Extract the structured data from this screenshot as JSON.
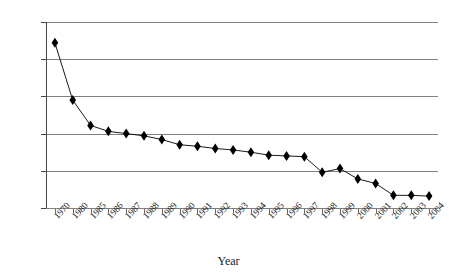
{
  "chart_data": {
    "type": "line",
    "title": "",
    "subtitle": "",
    "xlabel": "Year",
    "ylabel": "",
    "grid": true,
    "legend": false,
    "marker": "diamond",
    "ylim": [
      0,
      250
    ],
    "yticks": [
      0,
      50,
      100,
      150,
      200,
      250
    ],
    "categories": [
      "1970",
      "1980",
      "1985",
      "1986",
      "1987",
      "1988",
      "1989",
      "1990",
      "1991",
      "1992",
      "1993",
      "1994",
      "1995",
      "1996",
      "1997",
      "1998",
      "1999",
      "2000",
      "2001",
      "2002",
      "2003",
      "2004"
    ],
    "x": [
      "1970",
      "1980",
      "1985",
      "1986",
      "1987",
      "1988",
      "1989",
      "1990",
      "1991",
      "1992",
      "1993",
      "1994",
      "1995",
      "1996",
      "1997",
      "1998",
      "1999",
      "2000",
      "2001",
      "2002",
      "2003",
      "2004"
    ],
    "values": [
      222,
      145,
      111,
      103,
      100,
      97,
      92,
      85,
      83,
      80,
      78,
      75,
      71,
      70,
      69,
      48,
      53,
      39,
      33,
      17,
      17,
      16
    ],
    "points": [
      {
        "x": "1970",
        "y": 222
      },
      {
        "x": "1980",
        "y": 145
      },
      {
        "x": "1985",
        "y": 111
      },
      {
        "x": "1986",
        "y": 103
      },
      {
        "x": "1987",
        "y": 100
      },
      {
        "x": "1988",
        "y": 97
      },
      {
        "x": "1989",
        "y": 92
      },
      {
        "x": "1990",
        "y": 85
      },
      {
        "x": "1991",
        "y": 83
      },
      {
        "x": "1992",
        "y": 80
      },
      {
        "x": "1993",
        "y": 78
      },
      {
        "x": "1994",
        "y": 75
      },
      {
        "x": "1995",
        "y": 71
      },
      {
        "x": "1996",
        "y": 70
      },
      {
        "x": "1997",
        "y": 69
      },
      {
        "x": "1998",
        "y": 48
      },
      {
        "x": "1999",
        "y": 53
      },
      {
        "x": "2000",
        "y": 39
      },
      {
        "x": "2001",
        "y": 33
      },
      {
        "x": "2002",
        "y": 17
      },
      {
        "x": "2003",
        "y": 17
      },
      {
        "x": "2004",
        "y": 16
      }
    ],
    "series_color": "#000000",
    "grid_color": "#808080"
  },
  "axis": {
    "x_title": "Year",
    "y_tick_labels": [
      "0",
      "50",
      "100",
      "150",
      "200",
      "250"
    ],
    "x_tick_labels": [
      "1970",
      "1980",
      "1985",
      "1986",
      "1987",
      "1988",
      "1989",
      "1990",
      "1991",
      "1992",
      "1993",
      "1994",
      "1995",
      "1996",
      "1997",
      "1998",
      "1999",
      "2000",
      "2001",
      "2002",
      "2003",
      "2004"
    ]
  }
}
